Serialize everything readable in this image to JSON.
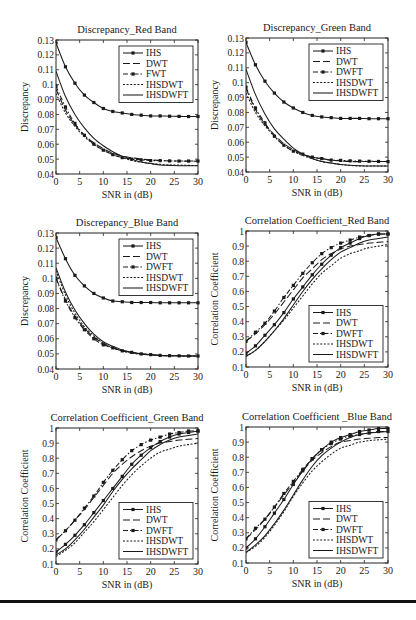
{
  "figure": {
    "rule_color": "#111111"
  },
  "chart_data": [
    {
      "id": "disc-red",
      "type": "line",
      "title": "Discrepancy_Red Band",
      "xlabel": "SNR in (dB)",
      "ylabel": "Discrepancy",
      "xlim": [
        0,
        30
      ],
      "ylim": [
        0.04,
        0.13
      ],
      "xticks": [
        0,
        5,
        10,
        15,
        20,
        25,
        30
      ],
      "yticks": [
        0.04,
        0.05,
        0.06,
        0.07,
        0.08,
        0.09,
        0.1,
        0.11,
        0.12,
        0.13
      ],
      "ytick_labels": [
        "0.04",
        "0.05",
        "0.06",
        "0.07",
        "0.08",
        "0.09",
        "0.1",
        "0.11",
        "0.12",
        "0.13"
      ],
      "legend_position": "upper right",
      "x": [
        0,
        2,
        4,
        6,
        8,
        10,
        12,
        14,
        16,
        18,
        20,
        22,
        24,
        26,
        28,
        30
      ],
      "series": [
        {
          "name": "IHS",
          "style": "solid-marker",
          "values": [
            0.128,
            0.112,
            0.101,
            0.093,
            0.088,
            0.084,
            0.082,
            0.081,
            0.08,
            0.0795,
            0.079,
            0.079,
            0.0788,
            0.0787,
            0.0786,
            0.0786
          ]
        },
        {
          "name": "DWT",
          "style": "dashed",
          "values": [
            0.097,
            0.083,
            0.073,
            0.066,
            0.061,
            0.057,
            0.054,
            0.052,
            0.051,
            0.05,
            0.0495,
            0.049,
            0.0488,
            0.0487,
            0.0486,
            0.0486
          ]
        },
        {
          "name": "FWT",
          "style": "dashdot-marker",
          "values": [
            0.099,
            0.085,
            0.074,
            0.066,
            0.06,
            0.056,
            0.053,
            0.051,
            0.05,
            0.0495,
            0.049,
            0.049,
            0.0488,
            0.0487,
            0.0487,
            0.0487
          ]
        },
        {
          "name": "IHSDWT",
          "style": "dotted",
          "values": [
            0.094,
            0.081,
            0.072,
            0.065,
            0.06,
            0.056,
            0.053,
            0.051,
            0.049,
            0.048,
            0.047,
            0.0465,
            0.046,
            0.046,
            0.0458,
            0.0457
          ]
        },
        {
          "name": "IHSDWFT",
          "style": "solid",
          "values": [
            0.109,
            0.092,
            0.08,
            0.071,
            0.064,
            0.059,
            0.055,
            0.052,
            0.05,
            0.048,
            0.047,
            0.046,
            0.0458,
            0.0456,
            0.0455,
            0.0455
          ]
        }
      ]
    },
    {
      "id": "disc-green",
      "type": "line",
      "title": "Discrepancy_Green Band",
      "xlabel": "SNR in (dB)",
      "ylabel": "Discrepancy",
      "xlim": [
        0,
        30
      ],
      "ylim": [
        0.04,
        0.13
      ],
      "xticks": [
        0,
        5,
        10,
        15,
        20,
        25,
        30
      ],
      "yticks": [
        0.04,
        0.05,
        0.06,
        0.07,
        0.08,
        0.09,
        0.1,
        0.11,
        0.12,
        0.13
      ],
      "ytick_labels": [
        "0.04",
        "0.05",
        "0.06",
        "0.07",
        "0.08",
        "0.09",
        "0.1",
        "0.11",
        "0.12",
        "0.13"
      ],
      "legend_position": "upper right",
      "x": [
        0,
        2,
        4,
        6,
        8,
        10,
        12,
        14,
        16,
        18,
        20,
        22,
        24,
        26,
        28,
        30
      ],
      "series": [
        {
          "name": "IHS",
          "style": "solid-marker",
          "values": [
            0.127,
            0.112,
            0.101,
            0.093,
            0.087,
            0.083,
            0.08,
            0.078,
            0.077,
            0.0765,
            0.076,
            0.076,
            0.076,
            0.0758,
            0.0758,
            0.0758
          ]
        },
        {
          "name": "DWT",
          "style": "dashed",
          "values": [
            0.096,
            0.082,
            0.072,
            0.065,
            0.059,
            0.055,
            0.052,
            0.05,
            0.049,
            0.048,
            0.0475,
            0.047,
            0.047,
            0.047,
            0.047,
            0.047
          ]
        },
        {
          "name": "DWFT",
          "style": "dashdot-marker",
          "values": [
            0.097,
            0.083,
            0.073,
            0.064,
            0.058,
            0.054,
            0.052,
            0.05,
            0.049,
            0.048,
            0.0478,
            0.0475,
            0.0473,
            0.0472,
            0.0471,
            0.047
          ]
        },
        {
          "name": "IHSDWT",
          "style": "dotted",
          "values": [
            0.093,
            0.08,
            0.071,
            0.064,
            0.058,
            0.054,
            0.051,
            0.049,
            0.047,
            0.046,
            0.045,
            0.0445,
            0.044,
            0.044,
            0.044,
            0.044
          ]
        },
        {
          "name": "IHSDWFT",
          "style": "solid",
          "values": [
            0.109,
            0.092,
            0.079,
            0.069,
            0.062,
            0.056,
            0.052,
            0.049,
            0.047,
            0.046,
            0.045,
            0.0445,
            0.0442,
            0.044,
            0.044,
            0.044
          ]
        }
      ]
    },
    {
      "id": "disc-blue",
      "type": "line",
      "title": "Discrepancy_Blue Band",
      "xlabel": "SNR in (dB)",
      "ylabel": "Discrepancy",
      "xlim": [
        0,
        30
      ],
      "ylim": [
        0.04,
        0.13
      ],
      "xticks": [
        0,
        5,
        10,
        15,
        20,
        25,
        30
      ],
      "yticks": [
        0.04,
        0.05,
        0.06,
        0.07,
        0.08,
        0.09,
        0.1,
        0.11,
        0.12,
        0.13
      ],
      "ytick_labels": [
        "0.04",
        "0.05",
        "0.06",
        "0.07",
        "0.08",
        "0.09",
        "0.1",
        "0.11",
        "0.12",
        "0.13"
      ],
      "legend_position": "upper right",
      "x": [
        0,
        2,
        4,
        6,
        8,
        10,
        12,
        14,
        16,
        18,
        20,
        22,
        24,
        26,
        28,
        30
      ],
      "series": [
        {
          "name": "IHS",
          "style": "solid-marker",
          "values": [
            0.127,
            0.113,
            0.102,
            0.095,
            0.09,
            0.087,
            0.085,
            0.0845,
            0.084,
            0.084,
            0.084,
            0.0838,
            0.0838,
            0.0838,
            0.0838,
            0.0838
          ]
        },
        {
          "name": "DWT",
          "style": "dashed",
          "values": [
            0.1,
            0.086,
            0.075,
            0.067,
            0.061,
            0.057,
            0.054,
            0.052,
            0.051,
            0.05,
            0.0495,
            0.049,
            0.0488,
            0.0487,
            0.0486,
            0.0486
          ]
        },
        {
          "name": "DWFT",
          "style": "dashdot-marker",
          "values": [
            0.1,
            0.085,
            0.074,
            0.066,
            0.06,
            0.056,
            0.054,
            0.052,
            0.051,
            0.05,
            0.0495,
            0.049,
            0.0488,
            0.0487,
            0.0486,
            0.0486
          ]
        },
        {
          "name": "IHSDWT",
          "style": "dotted",
          "values": [
            0.105,
            0.089,
            0.077,
            0.068,
            0.062,
            0.057,
            0.054,
            0.052,
            0.0505,
            0.0498,
            0.0493,
            0.049,
            0.0488,
            0.0487,
            0.0486,
            0.0486
          ]
        },
        {
          "name": "IHSDWFT",
          "style": "solid",
          "values": [
            0.107,
            0.091,
            0.079,
            0.07,
            0.063,
            0.058,
            0.055,
            0.0525,
            0.051,
            0.05,
            0.0494,
            0.049,
            0.0488,
            0.0487,
            0.0486,
            0.0486
          ]
        }
      ]
    },
    {
      "id": "corr-red",
      "type": "line",
      "title": "Correlation Coefficient_Red Band",
      "xlabel": "SNR in (dB)",
      "ylabel": "Correlation Coefficient",
      "xlim": [
        0,
        30
      ],
      "ylim": [
        0.1,
        1.0
      ],
      "xticks": [
        0,
        5,
        10,
        15,
        20,
        25,
        30
      ],
      "yticks": [
        0.1,
        0.2,
        0.3,
        0.4,
        0.5,
        0.6,
        0.7,
        0.8,
        0.9,
        1.0
      ],
      "ytick_labels": [
        "0.1",
        "0.2",
        "0.3",
        "0.4",
        "0.5",
        "0.6",
        "0.7",
        "0.8",
        "0.9",
        "1"
      ],
      "legend_position": "lower right",
      "x": [
        0,
        2,
        4,
        6,
        8,
        10,
        12,
        14,
        16,
        18,
        20,
        22,
        24,
        26,
        28,
        30
      ],
      "series": [
        {
          "name": "IHS",
          "style": "solid-marker",
          "values": [
            0.19,
            0.24,
            0.31,
            0.38,
            0.46,
            0.55,
            0.63,
            0.71,
            0.78,
            0.84,
            0.89,
            0.92,
            0.95,
            0.97,
            0.98,
            0.98
          ]
        },
        {
          "name": "DWT",
          "style": "dashed",
          "values": [
            0.27,
            0.32,
            0.38,
            0.45,
            0.53,
            0.61,
            0.69,
            0.75,
            0.81,
            0.85,
            0.88,
            0.9,
            0.91,
            0.92,
            0.925,
            0.93
          ]
        },
        {
          "name": "DWFT",
          "style": "dashdot-marker",
          "values": [
            0.27,
            0.33,
            0.39,
            0.47,
            0.56,
            0.64,
            0.72,
            0.79,
            0.85,
            0.89,
            0.92,
            0.94,
            0.96,
            0.97,
            0.98,
            0.98
          ]
        },
        {
          "name": "IHSDWT",
          "style": "dotted",
          "values": [
            0.17,
            0.21,
            0.27,
            0.34,
            0.41,
            0.49,
            0.57,
            0.65,
            0.72,
            0.77,
            0.82,
            0.85,
            0.87,
            0.89,
            0.9,
            0.91
          ]
        },
        {
          "name": "IHSDWFT",
          "style": "solid",
          "values": [
            0.17,
            0.21,
            0.27,
            0.34,
            0.42,
            0.51,
            0.6,
            0.68,
            0.75,
            0.81,
            0.86,
            0.89,
            0.92,
            0.94,
            0.95,
            0.96
          ]
        }
      ]
    },
    {
      "id": "corr-green",
      "type": "line",
      "title": "Correlation Coefficient_Green Band",
      "xlabel": "SNR in (dB)",
      "ylabel": "Correlation Coefficient",
      "xlim": [
        0,
        30
      ],
      "ylim": [
        0.1,
        1.0
      ],
      "xticks": [
        0,
        5,
        10,
        15,
        20,
        25,
        30
      ],
      "yticks": [
        0.1,
        0.2,
        0.3,
        0.4,
        0.5,
        0.6,
        0.7,
        0.8,
        0.9,
        1.0
      ],
      "ytick_labels": [
        "0.1",
        "0.2",
        "0.3",
        "0.4",
        "0.5",
        "0.6",
        "0.7",
        "0.8",
        "0.9",
        "1"
      ],
      "legend_position": "lower right",
      "x": [
        0,
        2,
        4,
        6,
        8,
        10,
        12,
        14,
        16,
        18,
        20,
        22,
        24,
        26,
        28,
        30
      ],
      "series": [
        {
          "name": "IHS",
          "style": "solid-marker",
          "values": [
            0.18,
            0.23,
            0.29,
            0.36,
            0.44,
            0.52,
            0.6,
            0.68,
            0.76,
            0.82,
            0.87,
            0.91,
            0.94,
            0.96,
            0.97,
            0.98
          ]
        },
        {
          "name": "DWT",
          "style": "dashed",
          "values": [
            0.26,
            0.32,
            0.39,
            0.46,
            0.54,
            0.62,
            0.7,
            0.76,
            0.81,
            0.85,
            0.88,
            0.9,
            0.91,
            0.92,
            0.925,
            0.93
          ]
        },
        {
          "name": "DWFT",
          "style": "dashdot-marker",
          "values": [
            0.26,
            0.32,
            0.39,
            0.47,
            0.55,
            0.64,
            0.72,
            0.79,
            0.85,
            0.89,
            0.92,
            0.94,
            0.96,
            0.97,
            0.98,
            0.98
          ]
        },
        {
          "name": "IHSDWT",
          "style": "dotted",
          "values": [
            0.15,
            0.19,
            0.24,
            0.31,
            0.38,
            0.46,
            0.54,
            0.62,
            0.69,
            0.75,
            0.8,
            0.84,
            0.86,
            0.88,
            0.89,
            0.9
          ]
        },
        {
          "name": "IHSDWFT",
          "style": "solid",
          "values": [
            0.16,
            0.2,
            0.26,
            0.33,
            0.41,
            0.49,
            0.58,
            0.66,
            0.73,
            0.79,
            0.85,
            0.89,
            0.92,
            0.94,
            0.95,
            0.96
          ]
        }
      ]
    },
    {
      "id": "corr-blue",
      "type": "line",
      "title": "Correlation Coefficient _Blue Band",
      "xlabel": "SNR in (dB)",
      "ylabel": "Correlation Coefficient",
      "xlim": [
        0,
        30
      ],
      "ylim": [
        0.1,
        1.0
      ],
      "xticks": [
        0,
        5,
        10,
        15,
        20,
        25,
        30
      ],
      "yticks": [
        0.1,
        0.2,
        0.3,
        0.4,
        0.5,
        0.6,
        0.7,
        0.8,
        0.9,
        1.0
      ],
      "ytick_labels": [
        "0.1",
        "0.2",
        "0.3",
        "0.4",
        "0.5",
        "0.6",
        "0.7",
        "0.8",
        "0.9",
        "1"
      ],
      "legend_position": "lower right",
      "x": [
        0,
        2,
        4,
        6,
        8,
        10,
        12,
        14,
        16,
        18,
        20,
        22,
        24,
        26,
        28,
        30
      ],
      "series": [
        {
          "name": "IHS",
          "style": "solid-marker",
          "values": [
            0.2,
            0.26,
            0.34,
            0.43,
            0.52,
            0.62,
            0.71,
            0.79,
            0.85,
            0.9,
            0.93,
            0.95,
            0.97,
            0.98,
            0.99,
            0.99
          ]
        },
        {
          "name": "DWT",
          "style": "dashed",
          "values": [
            0.26,
            0.32,
            0.39,
            0.47,
            0.55,
            0.63,
            0.71,
            0.78,
            0.83,
            0.87,
            0.9,
            0.91,
            0.92,
            0.925,
            0.93,
            0.93
          ]
        },
        {
          "name": "DWFT",
          "style": "dashdot-marker",
          "values": [
            0.26,
            0.33,
            0.39,
            0.47,
            0.56,
            0.64,
            0.72,
            0.79,
            0.85,
            0.89,
            0.92,
            0.94,
            0.95,
            0.96,
            0.97,
            0.97
          ]
        },
        {
          "name": "IHSDWT",
          "style": "dotted",
          "values": [
            0.17,
            0.21,
            0.27,
            0.35,
            0.44,
            0.54,
            0.63,
            0.71,
            0.77,
            0.82,
            0.86,
            0.88,
            0.9,
            0.91,
            0.915,
            0.92
          ]
        },
        {
          "name": "IHSDWFT",
          "style": "solid",
          "values": [
            0.17,
            0.22,
            0.28,
            0.36,
            0.45,
            0.55,
            0.65,
            0.74,
            0.81,
            0.86,
            0.9,
            0.93,
            0.95,
            0.96,
            0.965,
            0.97
          ]
        }
      ]
    }
  ]
}
